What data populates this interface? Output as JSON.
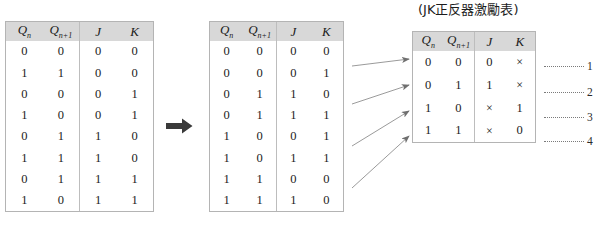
{
  "title": "(JK正反器激勵表)",
  "colors": {
    "header_bg": "#d8d8d8",
    "table_border": "#b4b4b4",
    "arrow_gray": "#8a8a8a",
    "block_arrow": "#3a3a3a",
    "text": "#1c1c1c"
  },
  "columns": {
    "q_now": "Q",
    "q_now_sub": "n",
    "q_next": "Q",
    "q_next_sub": "n+1",
    "j": "J",
    "k": "K"
  },
  "tables": [
    {
      "name": "unsorted-transition-table",
      "headers": [
        "Qn",
        "Qn+1",
        "J",
        "K"
      ],
      "rows": [
        [
          "0",
          "0",
          "0",
          "0"
        ],
        [
          "1",
          "1",
          "0",
          "0"
        ],
        [
          "0",
          "0",
          "0",
          "1"
        ],
        [
          "1",
          "0",
          "0",
          "1"
        ],
        [
          "0",
          "1",
          "1",
          "0"
        ],
        [
          "1",
          "1",
          "1",
          "0"
        ],
        [
          "0",
          "1",
          "1",
          "1"
        ],
        [
          "1",
          "0",
          "1",
          "1"
        ]
      ]
    },
    {
      "name": "sorted-transition-table",
      "headers": [
        "Qn",
        "Qn+1",
        "J",
        "K"
      ],
      "rows": [
        [
          "0",
          "0",
          "0",
          "0"
        ],
        [
          "0",
          "0",
          "0",
          "1"
        ],
        [
          "0",
          "1",
          "1",
          "0"
        ],
        [
          "0",
          "1",
          "1",
          "1"
        ],
        [
          "1",
          "0",
          "0",
          "1"
        ],
        [
          "1",
          "0",
          "1",
          "1"
        ],
        [
          "1",
          "1",
          "0",
          "0"
        ],
        [
          "1",
          "1",
          "1",
          "0"
        ]
      ]
    },
    {
      "name": "jk-excitation-table",
      "headers": [
        "Qn",
        "Qn+1",
        "J",
        "K"
      ],
      "rows": [
        [
          "0",
          "0",
          "0",
          "×"
        ],
        [
          "0",
          "1",
          "1",
          "×"
        ],
        [
          "1",
          "0",
          "×",
          "1"
        ],
        [
          "1",
          "1",
          "×",
          "0"
        ]
      ]
    }
  ],
  "row_indexes": [
    "1",
    "2",
    "3",
    "4"
  ],
  "mapping_arrows": [
    {
      "from_rows": "1-2",
      "to_row": "1"
    },
    {
      "from_rows": "3-4",
      "to_row": "2"
    },
    {
      "from_rows": "5-6",
      "to_row": "3"
    },
    {
      "from_rows": "7-8",
      "to_row": "4"
    }
  ],
  "block_arrow_label": "transforms-to"
}
